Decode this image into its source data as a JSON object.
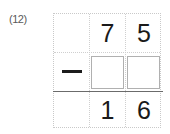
{
  "worksheet": {
    "problem_label": "(12)",
    "operation": "subtraction",
    "operator_symbol": "−",
    "minuend": {
      "display": "75",
      "tens_digit": "7",
      "ones_digit": "5"
    },
    "subtrahend": {
      "display": "",
      "tens_digit": "",
      "ones_digit": "",
      "tens_placeholder": "",
      "ones_placeholder": ""
    },
    "difference": {
      "display": "16",
      "tens_digit": "1",
      "ones_digit": "6"
    },
    "colors": {
      "digit_ink": "#1a1a1a",
      "grid_dots": "#cfcfcf",
      "answer_rule": "#6b6b6b",
      "box_border": "#b0b0b0",
      "label_ink": "#5a5a5a",
      "paper": "#ffffff"
    }
  }
}
